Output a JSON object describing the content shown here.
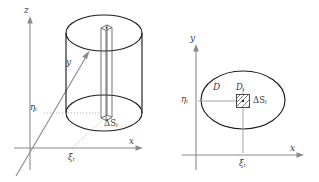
{
  "figure": {
    "caption_absent": true,
    "panels": [
      {
        "id": "left",
        "name": "three-dimensional-cylinder-over-region",
        "axes": {
          "z_label": "z",
          "y_label": "y",
          "x_label": "x"
        },
        "labels": {
          "eta": "η",
          "eta_sub": "i",
          "xi": "ξ",
          "xi_sub": "i",
          "delta_s": "ΔS",
          "delta_s_sub": "i"
        }
      },
      {
        "id": "right",
        "name": "planar-region-with-subregion",
        "axes": {
          "y_label": "y",
          "x_label": "x"
        },
        "labels": {
          "region": "D",
          "subregion": "D",
          "subregion_sub": "i",
          "eta": "η",
          "eta_sub": "i",
          "xi": "ξ",
          "xi_sub": "i",
          "delta_s": "ΔS",
          "delta_s_sub": "i"
        }
      }
    ],
    "colors": {
      "background": "#ffffff",
      "axis": "#8a8a8a",
      "curve": "#1d1d1d",
      "guide": "#a9a9a9",
      "text": "#3c3c3c"
    }
  }
}
